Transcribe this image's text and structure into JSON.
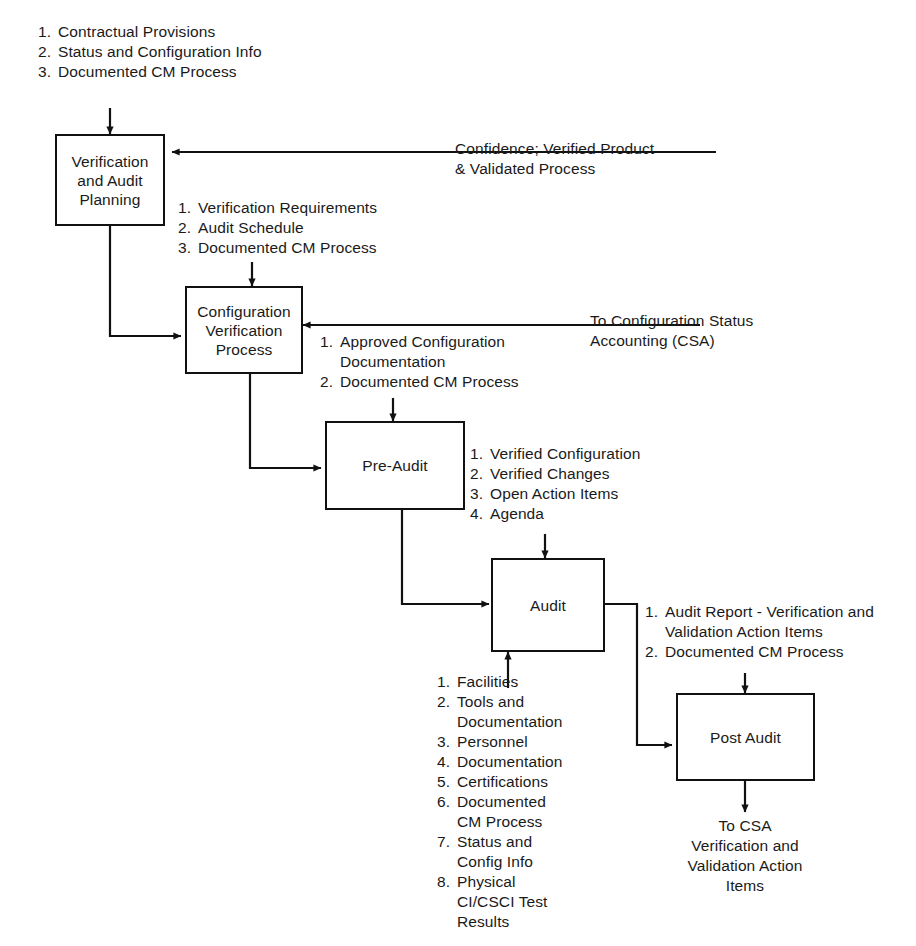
{
  "diagram": {
    "type": "flowchart",
    "stroke_color": "#111111",
    "text_color": "#1a1a1a",
    "background": "#ffffff"
  },
  "nodes": {
    "verification_and_audit_planning": "Verification\nand Audit\nPlanning",
    "configuration_verification_process": "Configuration\nVerification\nProcess",
    "pre_audit": "Pre-Audit",
    "audit": "Audit",
    "post_audit": "Post Audit"
  },
  "lists": {
    "planning_inputs": [
      "Contractual Provisions",
      "Status and Configuration Info",
      "Documented CM Process"
    ],
    "planning_outputs": [
      "Verification Requirements",
      "Audit Schedule",
      "Documented CM Process"
    ],
    "verification_outputs": [
      "Approved Configuration Documentation",
      "Documented CM Process"
    ],
    "pre_audit_outputs": [
      "Verified Configuration",
      "Verified Changes",
      "Open Action Items",
      "Agenda"
    ],
    "audit_inputs": [
      "Facilities",
      "Tools and Documentation",
      "Personnel",
      "Documentation",
      "Certifications",
      "Documented CM Process",
      "Status and Config Info",
      "Physical CI/CSCI Test Results"
    ],
    "audit_outputs": [
      "Audit Report - Verification and Validation Action Items",
      "Documented CM Process"
    ]
  },
  "annotations": {
    "confidence_feedback": "Confidence; Verified Product\n& Validated Process",
    "to_csa": "To Configuration Status\nAccounting (CSA)",
    "post_audit_output": "To CSA\nVerification and\nValidation Action\nItems"
  }
}
